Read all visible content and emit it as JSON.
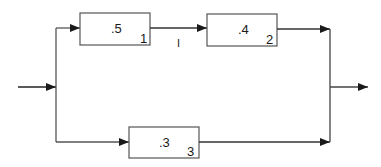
{
  "diagram": {
    "type": "reliability-block-diagram",
    "blocks": [
      {
        "id": "1",
        "value": ".5",
        "index": "1"
      },
      {
        "id": "2",
        "value": ".4",
        "index": "2"
      },
      {
        "id": "3",
        "value": ".3",
        "index": "3"
      }
    ],
    "connector_label": "I",
    "colors": {
      "line": "#333333",
      "box_stroke": "#555555",
      "background": "#ffffff"
    }
  }
}
